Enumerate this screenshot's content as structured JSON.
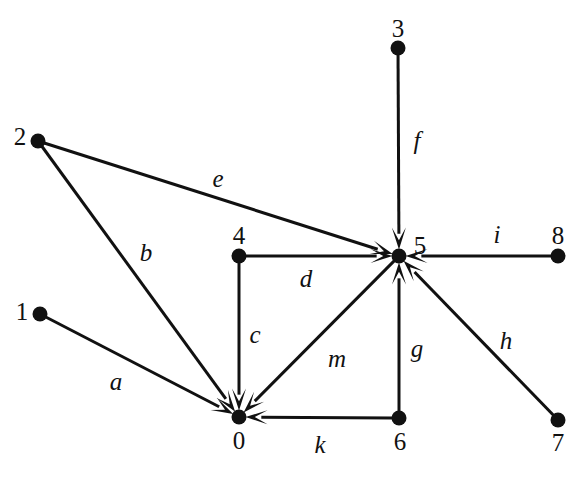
{
  "figure": {
    "type": "directed-graph",
    "width": 588,
    "height": 479,
    "background_color": "#ffffff",
    "ink_color": "#111111",
    "node_radius": 7.5,
    "edge_width": 3
  },
  "nodes": [
    {
      "id": "0",
      "label": "0",
      "x": 239,
      "y": 417,
      "label_x": 239,
      "label_y": 440,
      "label_position": "below"
    },
    {
      "id": "1",
      "label": "1",
      "x": 40,
      "y": 314,
      "label_x": 22,
      "label_y": 311,
      "label_position": "left"
    },
    {
      "id": "2",
      "label": "2",
      "x": 38,
      "y": 141,
      "label_x": 20,
      "label_y": 136,
      "label_position": "left"
    },
    {
      "id": "3",
      "label": "3",
      "x": 398,
      "y": 48,
      "label_x": 398,
      "label_y": 28,
      "label_position": "above"
    },
    {
      "id": "4",
      "label": "4",
      "x": 239,
      "y": 256,
      "label_x": 239,
      "label_y": 235,
      "label_position": "above"
    },
    {
      "id": "5",
      "label": "5",
      "x": 399,
      "y": 256,
      "label_x": 420,
      "label_y": 245,
      "label_position": "upper-right"
    },
    {
      "id": "6",
      "label": "6",
      "x": 399,
      "y": 418,
      "label_x": 400,
      "label_y": 441,
      "label_position": "below"
    },
    {
      "id": "7",
      "label": "7",
      "x": 558,
      "y": 420,
      "label_x": 558,
      "label_y": 442,
      "label_position": "below"
    },
    {
      "id": "8",
      "label": "8",
      "x": 558,
      "y": 256,
      "label_x": 558,
      "label_y": 235,
      "label_position": "above"
    }
  ],
  "edges": [
    {
      "id": "a",
      "label": "a",
      "from": "1",
      "to": "0",
      "directed": true,
      "label_x": 116,
      "label_y": 381
    },
    {
      "id": "b",
      "label": "b",
      "from": "2",
      "to": "0",
      "directed": true,
      "label_x": 146,
      "label_y": 252
    },
    {
      "id": "c",
      "label": "c",
      "from": "4",
      "to": "0",
      "directed": true,
      "label_x": 255,
      "label_y": 334
    },
    {
      "id": "d",
      "label": "d",
      "from": "4",
      "to": "5",
      "directed": true,
      "label_x": 306,
      "label_y": 278
    },
    {
      "id": "e",
      "label": "e",
      "from": "2",
      "to": "5",
      "directed": true,
      "label_x": 218,
      "label_y": 178
    },
    {
      "id": "f",
      "label": "f",
      "from": "3",
      "to": "5",
      "directed": true,
      "label_x": 417,
      "label_y": 140
    },
    {
      "id": "g",
      "label": "g",
      "from": "6",
      "to": "5",
      "directed": true,
      "label_x": 417,
      "label_y": 348
    },
    {
      "id": "h",
      "label": "h",
      "from": "7",
      "to": "5",
      "directed": true,
      "label_x": 506,
      "label_y": 340
    },
    {
      "id": "i",
      "label": "i",
      "from": "8",
      "to": "5",
      "directed": true,
      "label_x": 497,
      "label_y": 234
    },
    {
      "id": "k",
      "label": "k",
      "from": "6",
      "to": "0",
      "directed": true,
      "label_x": 320,
      "label_y": 444
    },
    {
      "id": "m",
      "label": "m",
      "from": "5",
      "to": "0",
      "directed": true,
      "label_x": 337,
      "label_y": 358
    }
  ]
}
